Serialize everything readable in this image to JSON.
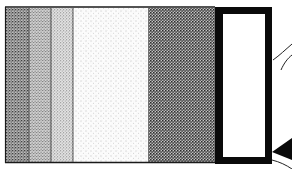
{
  "figure": {
    "type": "patent-style stippled cross-section drawing",
    "bands": [
      {
        "id": "band-1",
        "shade": "dark stipple",
        "color": "#8a8a8a"
      },
      {
        "id": "band-2",
        "shade": "medium stipple",
        "color": "#b4b4b4"
      },
      {
        "id": "band-3",
        "shade": "light stipple",
        "color": "#cfcfcf"
      },
      {
        "id": "band-4",
        "shade": "very light stipple",
        "color": "#f0f0f0"
      },
      {
        "id": "band-5",
        "shade": "dense dark stipple",
        "color": "#6e6e6e"
      }
    ],
    "frame": {
      "shade": "solid black border",
      "inner": "white"
    },
    "edge_detail": "curved lead line and black wedge at right edge"
  }
}
